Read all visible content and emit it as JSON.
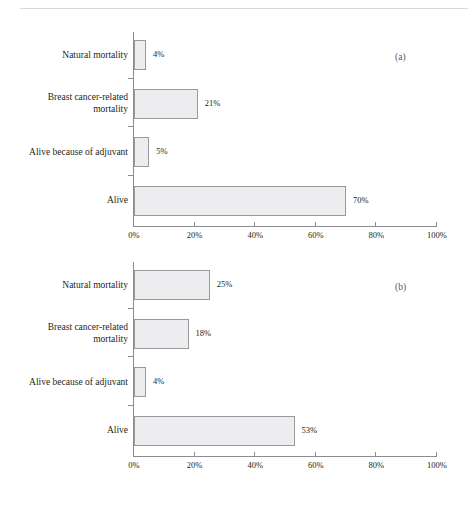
{
  "page": {
    "running_head": "",
    "background": "#ffffff",
    "bar_fill": "#ededef",
    "bar_stroke": "#9a9a9d",
    "axis_color": "#8d8d90"
  },
  "chart_data": [
    {
      "type": "bar",
      "orientation": "horizontal",
      "tag": "(a)",
      "title": "",
      "subtitle": "",
      "xlabel": "",
      "ylabel": "",
      "xlim": [
        0,
        100
      ],
      "xticks": [
        0,
        20,
        40,
        60,
        80,
        100
      ],
      "xticklabels": [
        "0%",
        "20%",
        "40%",
        "60%",
        "80%",
        "100%"
      ],
      "grid": false,
      "legend": null,
      "categories": [
        "Natural mortality",
        "Breast cancer-related mortality",
        "Alive because of adjuvant",
        "Alive"
      ],
      "category_lines": [
        [
          "Natural mortality"
        ],
        [
          "Breast cancer-related",
          "mortality"
        ],
        [
          "Alive because of adjuvant"
        ],
        [
          "Alive"
        ]
      ],
      "values": [
        4,
        21,
        5,
        70
      ],
      "data_labels": [
        "4%",
        "21%",
        "5%",
        "70%"
      ]
    },
    {
      "type": "bar",
      "orientation": "horizontal",
      "tag": "(b)",
      "title": "",
      "subtitle": "",
      "xlabel": "",
      "ylabel": "",
      "xlim": [
        0,
        100
      ],
      "xticks": [
        0,
        20,
        40,
        60,
        80,
        100
      ],
      "xticklabels": [
        "0%",
        "20%",
        "40%",
        "60%",
        "80%",
        "100%"
      ],
      "grid": false,
      "legend": null,
      "categories": [
        "Natural mortality",
        "Breast cancer-related mortality",
        "Alive because of adjuvant",
        "Alive"
      ],
      "category_lines": [
        [
          "Natural mortality"
        ],
        [
          "Breast cancer-related",
          "mortality"
        ],
        [
          "Alive because of adjuvant"
        ],
        [
          "Alive"
        ]
      ],
      "values": [
        25,
        18,
        4,
        53
      ],
      "data_labels": [
        "25%",
        "18%",
        "4%",
        "53%"
      ]
    }
  ]
}
